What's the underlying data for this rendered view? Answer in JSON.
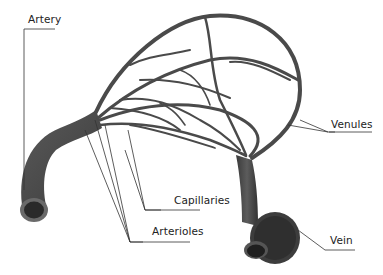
{
  "diagram": {
    "labels": {
      "artery": "Artery",
      "venules": "Venules",
      "capillaries": "Capillaries",
      "arterioles": "Arterioles",
      "vein": "Vein"
    },
    "colors": {
      "vessel": "#4a4a4a",
      "vessel_dark": "#2e2e2e",
      "vessel_light": "#7a7a7a",
      "leader_line": "#333333",
      "background": "#ffffff"
    }
  }
}
